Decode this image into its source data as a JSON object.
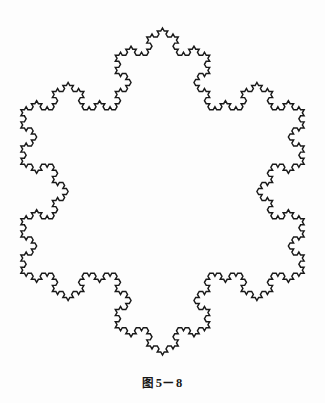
{
  "page": {
    "background_color": "#fdfdfd",
    "width": 325,
    "height": 403
  },
  "figure": {
    "name": "koch-snowflake",
    "stroke_color": "#191919",
    "fill_color": "none",
    "stroke_width": 1.45
  },
  "caption": {
    "full_text": "图 5－8",
    "label": "图",
    "number": "5－8"
  },
  "chart_data": {
    "type": "line",
    "subtitle": "",
    "xlabel": "",
    "ylabel": "",
    "grid": false,
    "legend": null,
    "fractal": {
      "name": "Koch snowflake",
      "iterations": 4,
      "initiator": "equilateral triangle",
      "generator": "replace each segment with 4 segments of 1/3 length, middle two forming an outward 60-degree spike",
      "segment_count": 768,
      "hausdorff_dimension": 1.2619,
      "rotation_degrees": -90,
      "closed": true
    },
    "bounds": {
      "x_min": 20,
      "x_max": 305,
      "y_min": 28,
      "y_max": 355
    },
    "center": {
      "x": 162.5,
      "y": 196
    },
    "circumradius": 168,
    "major_vertices": [
      {
        "name": "top",
        "x": 162.5,
        "y": 28
      },
      {
        "name": "upper-right",
        "x": 308,
        "y": 112
      },
      {
        "name": "lower-right",
        "x": 308,
        "y": 280
      },
      {
        "name": "bottom",
        "x": 162.5,
        "y": 364
      },
      {
        "name": "lower-left",
        "x": 17,
        "y": 280
      },
      {
        "name": "upper-left",
        "x": 17,
        "y": 112
      }
    ],
    "star_points": [
      {
        "name": "top-spike",
        "x": 162.5,
        "y": 28
      },
      {
        "name": "right-spike",
        "x": 305,
        "y": 215
      },
      {
        "name": "left-spike",
        "x": 20,
        "y": 215
      },
      {
        "name": "bottom-spike",
        "x": 162.5,
        "y": 355
      }
    ],
    "ylim": [
      0,
      368
    ],
    "xlim": [
      0,
      325
    ]
  }
}
